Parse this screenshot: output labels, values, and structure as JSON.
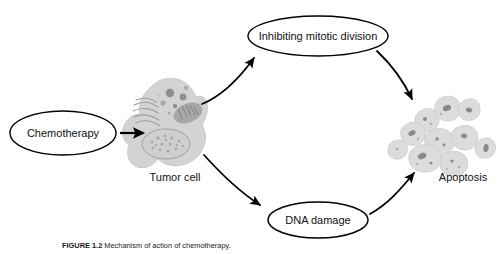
{
  "figure": {
    "caption_number": "FIGURE 1.2",
    "caption_text": "Mechanism of action of chemotherapy.",
    "background_color": "#ffffff",
    "line_color": "#000000",
    "cell_fill_color": "#d3d3d3",
    "organelle_color": "#8f8f8f"
  },
  "nodes": {
    "chemotherapy": {
      "label": "Chemotherapy",
      "shape": "ellipse",
      "cx": 63,
      "cy": 133,
      "rx": 53,
      "ry": 22
    },
    "inhibiting_mitotic_division": {
      "label": "Inhibiting mitotic division",
      "shape": "ellipse",
      "cx": 318,
      "cy": 36,
      "rx": 70,
      "ry": 20
    },
    "dna_damage": {
      "label": "DNA damage",
      "shape": "ellipse",
      "cx": 318,
      "cy": 220,
      "rx": 50,
      "ry": 18
    },
    "tumor_cell": {
      "label": "Tumor cell",
      "shape": "cell-illustration",
      "label_x": 175,
      "label_y": 178
    },
    "apoptosis": {
      "label": "Apoptosis",
      "shape": "fragmented-cell-cluster",
      "label_x": 463,
      "label_y": 178
    }
  },
  "edges": [
    {
      "name": "chemotherapy-to-tumor-cell",
      "from": "chemotherapy",
      "to": "tumor_cell",
      "style": "straight-arrow"
    },
    {
      "name": "tumor-cell-to-inhibiting-mitotic-division",
      "from": "tumor_cell",
      "to": "inhibiting_mitotic_division",
      "style": "curved-arrow"
    },
    {
      "name": "tumor-cell-to-dna-damage",
      "from": "tumor_cell",
      "to": "dna_damage",
      "style": "curved-arrow"
    },
    {
      "name": "inhibiting-mitotic-division-to-apoptosis",
      "from": "inhibiting_mitotic_division",
      "to": "apoptosis",
      "style": "curved-arrow"
    },
    {
      "name": "dna-damage-to-apoptosis",
      "from": "dna_damage",
      "to": "apoptosis",
      "style": "curved-arrow"
    }
  ]
}
